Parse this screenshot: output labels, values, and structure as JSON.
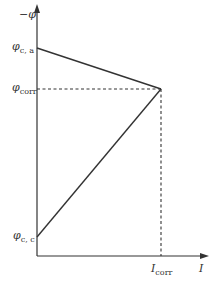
{
  "diagram": {
    "type": "evans-diagram",
    "colors": {
      "line": "#333333",
      "background": "#ffffff"
    },
    "axes": {
      "y_label": "−φ",
      "x_label": "I"
    },
    "labels": {
      "phi_ca": {
        "symbol": "φ",
        "subscript": "c, a"
      },
      "phi_corr": {
        "symbol": "φ",
        "subscript": "corr"
      },
      "phi_cc": {
        "symbol": "φ",
        "subscript": "c, c"
      },
      "i_corr": {
        "symbol": "I",
        "subscript": "corr"
      }
    },
    "lines": [
      {
        "name": "anodic-line",
        "from": "phi_ca",
        "to": "intersection"
      },
      {
        "name": "cathodic-line",
        "from": "phi_cc",
        "to": "intersection"
      }
    ],
    "guides": [
      {
        "name": "phi-corr-guide",
        "style": "dashed"
      },
      {
        "name": "i-corr-guide",
        "style": "dashed"
      }
    ]
  }
}
